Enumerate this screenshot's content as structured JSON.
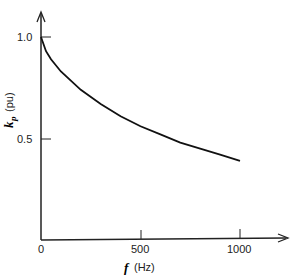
{
  "chart_data": {
    "type": "line",
    "title": "",
    "xlabel_symbol": "f",
    "xlabel_unit": "(Hz)",
    "ylabel_symbol": "k",
    "ylabel_sub": "p",
    "ylabel_unit": "(pu)",
    "xlim": [
      0,
      1200
    ],
    "ylim": [
      0,
      1.1
    ],
    "x_ticks": [
      "0",
      "500",
      "1000"
    ],
    "y_ticks": [
      "1.0",
      "0.5"
    ],
    "grid": false,
    "series": [
      {
        "name": "k_p",
        "x": [
          0,
          25,
          50,
          100,
          200,
          300,
          400,
          500,
          600,
          700,
          800,
          900,
          1000
        ],
        "values": [
          1.0,
          0.93,
          0.89,
          0.83,
          0.74,
          0.67,
          0.61,
          0.56,
          0.52,
          0.48,
          0.45,
          0.42,
          0.39
        ]
      }
    ]
  }
}
